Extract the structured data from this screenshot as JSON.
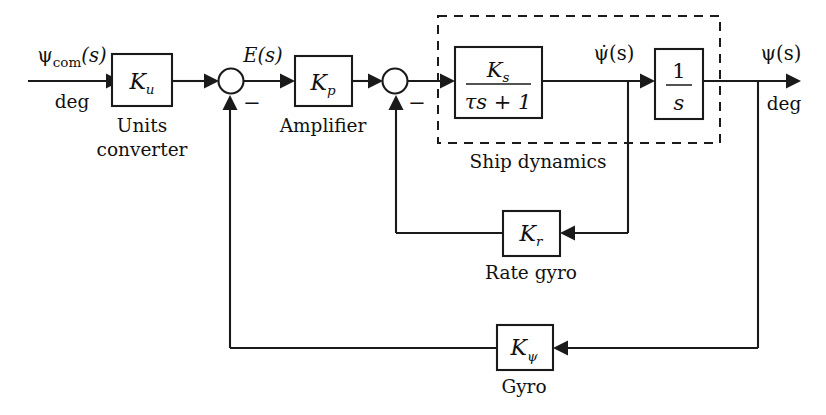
{
  "diagram": {
    "input": {
      "signal": "ψ",
      "signal_sub": "com",
      "signal_arg": "(s)",
      "units": "deg"
    },
    "output": {
      "signal": "ψ(s)",
      "units": "deg"
    },
    "intermediate": {
      "error": "E(s)",
      "rate": "ψ̇(s)"
    },
    "blocks": [
      {
        "id": "units-converter",
        "gain": "K",
        "gain_sub": "u",
        "caption_line1": "Units",
        "caption_line2": "converter"
      },
      {
        "id": "amplifier",
        "gain": "K",
        "gain_sub": "p",
        "caption_line1": "Amplifier",
        "caption_line2": ""
      },
      {
        "id": "ship-transfer",
        "numerator": "K",
        "numerator_sub": "s",
        "denominator": "τs + 1",
        "caption_line1": "",
        "caption_line2": ""
      },
      {
        "id": "integrator",
        "numerator": "1",
        "denominator": "s",
        "caption_line1": "",
        "caption_line2": ""
      },
      {
        "id": "rate-gyro",
        "gain": "K",
        "gain_sub": "r",
        "caption_line1": "Rate gyro",
        "caption_line2": ""
      },
      {
        "id": "gyro",
        "gain": "K",
        "gain_sub": "ψ",
        "caption_line1": "Gyro",
        "caption_line2": ""
      }
    ],
    "group": {
      "id": "ship-dynamics",
      "caption": "Ship dynamics"
    },
    "summing_junctions": [
      {
        "id": "sum-1",
        "feedback_sign": "−"
      },
      {
        "id": "sum-2",
        "feedback_sign": "−"
      }
    ],
    "colors": {
      "line": "#1a1a1a",
      "text": "#111111",
      "background": "#ffffff"
    }
  }
}
